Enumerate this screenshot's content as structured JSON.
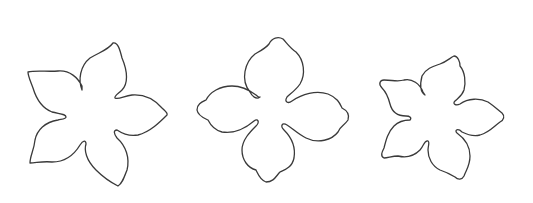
{
  "image": {
    "description": "Three flower-shaped petal outline templates on a white background",
    "background_color": "#ffffff",
    "stroke_color": "#3a3a3a"
  },
  "shapes": [
    {
      "name": "five-petal-pointed-flower",
      "petals": 5,
      "position": "left"
    },
    {
      "name": "four-petal-rounded-flower",
      "petals": 4,
      "position": "center"
    },
    {
      "name": "five-petal-small-flower",
      "petals": 5,
      "position": "right"
    }
  ]
}
